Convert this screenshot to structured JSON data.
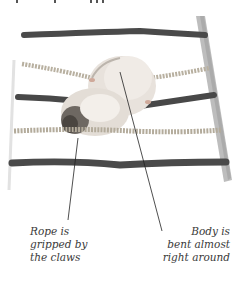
{
  "figure": {
    "colors": {
      "dark_rope": "#4a4a4a",
      "twisted_rope": "#b8b0a0",
      "ladder_rail": "#b5b5b5",
      "hamster_fur": "#e6e0da",
      "hamster_shadow": "#8a8580",
      "leader_line": "#222222",
      "caption_text": "#3a3a3a"
    }
  },
  "annotations": [
    {
      "id": "rope-claws",
      "lines": [
        "Rope is",
        "gripped by",
        "the claws"
      ]
    },
    {
      "id": "body-bent",
      "lines": [
        "Body is",
        "bent almost",
        "right around"
      ]
    }
  ]
}
